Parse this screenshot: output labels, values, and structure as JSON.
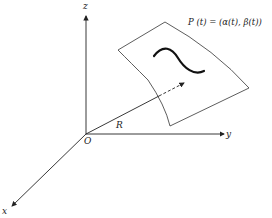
{
  "diagram": {
    "labels": {
      "z_axis": "z",
      "y_axis": "y",
      "x_axis": "x",
      "origin": "O",
      "radius_vector": "R",
      "curve_param": "P (t) = (α(t), β(t))"
    },
    "colors": {
      "stroke": "#222222",
      "background": "#ffffff"
    },
    "elements": [
      "z-axis arrow",
      "y-axis arrow",
      "x-axis arrow",
      "curved surface patch",
      "curve on surface",
      "position vector R from origin to surface (dashed beyond surface)"
    ]
  }
}
